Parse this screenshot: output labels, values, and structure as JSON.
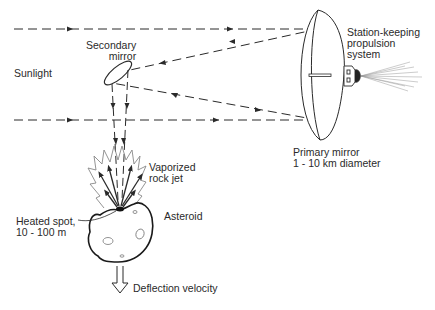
{
  "diagram": {
    "labels": {
      "sunlight": "Sunlight",
      "secondary_mirror": [
        "Secondary",
        "mirror"
      ],
      "station_keeping": [
        "Station-keeping",
        "propulsion",
        "system"
      ],
      "primary_mirror": [
        "Primary mirror",
        "1 - 10 km diameter"
      ],
      "vaporized_jet": [
        "Vaporized",
        "rock jet"
      ],
      "heated_spot": [
        "Heated spot,",
        "10 - 100 m"
      ],
      "asteroid": "Asteroid",
      "deflection": "Deflection velocity"
    },
    "colors": {
      "line": "#2a2a2a",
      "background": "#ffffff"
    }
  }
}
